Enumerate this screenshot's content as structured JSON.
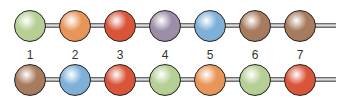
{
  "diagram": {
    "labels": [
      "1",
      "2",
      "3",
      "4",
      "5",
      "6",
      "7"
    ],
    "rows": [
      {
        "name": "chain-top",
        "beads": [
          {
            "color": "green",
            "hex": "#b5cf95"
          },
          {
            "color": "orange",
            "hex": "#e8955a"
          },
          {
            "color": "red",
            "hex": "#d9553a"
          },
          {
            "color": "purple",
            "hex": "#9c8ea8"
          },
          {
            "color": "blue",
            "hex": "#7fb0d8"
          },
          {
            "color": "brown",
            "hex": "#a77b5e"
          },
          {
            "color": "brown",
            "hex": "#a77b5e"
          }
        ]
      },
      {
        "name": "chain-bottom",
        "beads": [
          {
            "color": "brown",
            "hex": "#a77b5e"
          },
          {
            "color": "blue",
            "hex": "#7fb0d8"
          },
          {
            "color": "red",
            "hex": "#d9553a"
          },
          {
            "color": "green",
            "hex": "#b5cf95"
          },
          {
            "color": "orange",
            "hex": "#e8955a"
          },
          {
            "color": "green",
            "hex": "#b5cf95"
          },
          {
            "color": "red",
            "hex": "#d9553a"
          }
        ]
      }
    ]
  }
}
